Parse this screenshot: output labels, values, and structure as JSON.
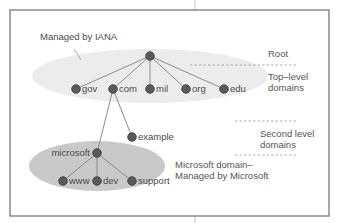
{
  "diagram": {
    "title_annotation": "Managed by IANA",
    "colors": {
      "frame": "#8a8a8a",
      "iana_ellipse": "#ececec",
      "microsoft_ellipse": "#c9c9c9",
      "node_fill": "#5a5a5a",
      "node_stroke": "#3a3a3a",
      "edge": "#8c8c8c",
      "dash": "#9a9a9a",
      "text": "#4a4a4a"
    },
    "levels": {
      "root": "Root",
      "top_level_line1": "Top–level",
      "top_level_line2": "domains",
      "second_level_line1": "Second level",
      "second_level_line2": "domains",
      "microsoft_domain_line1": "Microsoft domain–",
      "microsoft_domain_line2": "Managed by Microsoft"
    },
    "nodes": {
      "root": {
        "label": "",
        "x": 150,
        "y": 56
      },
      "gov": {
        "label": "gov",
        "x": 76,
        "y": 89
      },
      "com": {
        "label": "com",
        "x": 113,
        "y": 89
      },
      "mil": {
        "label": "mil",
        "x": 150,
        "y": 89
      },
      "org": {
        "label": "org",
        "x": 186,
        "y": 89
      },
      "edu": {
        "label": "edu",
        "x": 224,
        "y": 89
      },
      "example": {
        "label": "example",
        "x": 132,
        "y": 137
      },
      "microsoft": {
        "label": "microsoft",
        "x": 97,
        "y": 153
      },
      "www": {
        "label": "www",
        "x": 63,
        "y": 181
      },
      "dev": {
        "label": "dev",
        "x": 97,
        "y": 181
      },
      "support": {
        "label": "support",
        "x": 132,
        "y": 181
      }
    },
    "edges": [
      [
        "root",
        "gov"
      ],
      [
        "root",
        "com"
      ],
      [
        "root",
        "mil"
      ],
      [
        "root",
        "org"
      ],
      [
        "root",
        "edu"
      ],
      [
        "com",
        "example"
      ],
      [
        "com",
        "microsoft"
      ],
      [
        "microsoft",
        "www"
      ],
      [
        "microsoft",
        "dev"
      ],
      [
        "microsoft",
        "support"
      ]
    ]
  }
}
